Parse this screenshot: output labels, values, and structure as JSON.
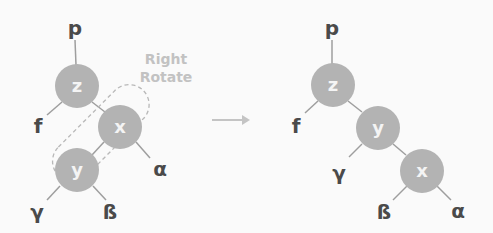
{
  "caption": {
    "line1": "Right",
    "line2": "Rotate"
  },
  "colors": {
    "node": "#b3b3b3",
    "edge": "#9e9e9e",
    "label": "#4a4a4a",
    "caption": "#c2c2c2",
    "background": "#fafafa"
  },
  "before": {
    "parent": "p",
    "nodes": {
      "z": "z",
      "x": "x",
      "y": "y"
    },
    "subtrees": {
      "f": "f",
      "alpha": "α",
      "gamma": "γ",
      "beta": "ß"
    }
  },
  "after": {
    "parent": "p",
    "nodes": {
      "z": "z",
      "y": "y",
      "x": "x"
    },
    "subtrees": {
      "f": "f",
      "gamma": "γ",
      "beta": "ß",
      "alpha": "α"
    }
  },
  "arrow": "right-arrow"
}
